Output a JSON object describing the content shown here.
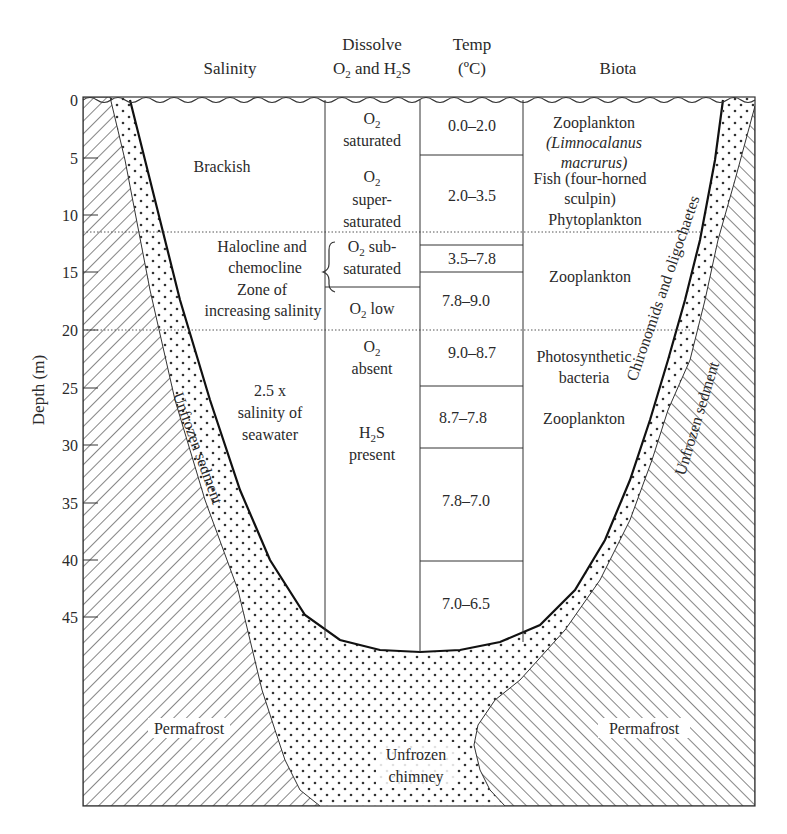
{
  "headers": {
    "salinity": "Salinity",
    "dissolve_line1": "Dissolve",
    "dissolve_line2_a": "O",
    "dissolve_line2_b": "2",
    "dissolve_line2_c": " and H",
    "dissolve_line2_d": "2",
    "dissolve_line2_e": "S",
    "temp_line1": "Temp",
    "temp_line2": "(ºC)",
    "biota": "Biota"
  },
  "axis": {
    "ylabel": "Depth (m)",
    "ticks": [
      "0",
      "5",
      "10",
      "15",
      "20",
      "25",
      "30",
      "35",
      "40",
      "45"
    ]
  },
  "salinity": {
    "brackish": "Brackish",
    "halocline_1": "Halocline and",
    "halocline_2": "chemocline",
    "halocline_3": "Zone of",
    "halocline_4": "increasing salinity",
    "deep_1": "2.5 x",
    "deep_2": "salinity of",
    "deep_3": "seawater"
  },
  "oxygen": {
    "saturated_a": "O",
    "saturated_sub": "2",
    "saturated_b": "saturated",
    "super_a": "O",
    "super_sub": "2",
    "super_b": "super-",
    "super_c": "saturated",
    "subsat_a": "O",
    "subsat_sub": "2",
    "subsat_b": " sub-",
    "subsat_c": "saturated",
    "low_a": "O",
    "low_sub": "2",
    "low_b": " low",
    "absent_a": "O",
    "absent_sub": "2",
    "absent_b": "absent",
    "h2s_a": "H",
    "h2s_sub": "2",
    "h2s_b": "S",
    "h2s_c": "present"
  },
  "temperature": [
    "0.0–2.0",
    "2.0–3.5",
    "3.5–7.8",
    "7.8–9.0",
    "9.0–8.7",
    "8.7–7.8",
    "7.8–7.0",
    "7.0–6.5"
  ],
  "biota": {
    "zoo1": "Zooplankton",
    "zoo1_species_1": "(Limnocalanus",
    "zoo1_species_2": "macrurus)",
    "fish_1": "Fish (four-horned",
    "fish_2": "sculpin)",
    "phyto": "Phytoplankton",
    "zoo2": "Zooplankton",
    "photo_1": "Photosynthetic",
    "photo_2": "bacteria",
    "zoo3": "Zooplankton",
    "benthic": "Chironomids and oligochaetes"
  },
  "sediment": {
    "unfrozen_left": "Unfrozen sedment",
    "unfrozen_right": "Unfrozen sedment",
    "permafrost_left": "Permafrost",
    "permafrost_right": "Permafrost",
    "chimney_1": "Unfrozen",
    "chimney_2": "chimney"
  }
}
